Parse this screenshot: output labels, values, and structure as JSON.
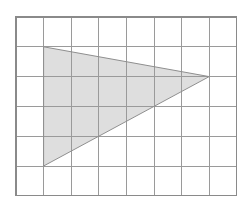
{
  "figure": {
    "background_color": "#ffffff"
  },
  "chart_data": {
    "type": "diagram",
    "grid": {
      "columns": 8,
      "rows": 6,
      "cell_width_units": 1,
      "cell_height_units": 1,
      "line_color": "#9a9a9a",
      "border_color": "#8a8a8a",
      "line_width_px": 1,
      "origin_px": {
        "x": 16,
        "y": 17
      },
      "cell_size_px": {
        "width": 27.6,
        "height": 29.8
      },
      "vertical_line_positions_px": [
        16,
        43.6,
        71.2,
        98.8,
        126.4,
        154,
        181.6,
        209.2,
        236.8
      ],
      "horizontal_line_positions_px": [
        17,
        46.8,
        76.6,
        106.4,
        136.2,
        166,
        195.8
      ]
    },
    "shapes": [
      {
        "name": "shaded-triangle",
        "type": "polygon",
        "vertices_grid": [
          {
            "col": 1,
            "row": 1
          },
          {
            "col": 7,
            "row": 2
          },
          {
            "col": 1,
            "row": 5
          }
        ],
        "vertices_px": [
          {
            "x": 43.6,
            "y": 46.8
          },
          {
            "x": 209.2,
            "y": 76.6
          },
          {
            "x": 43.6,
            "y": 166.0
          }
        ],
        "fill_color": "#dedede",
        "stroke_color": "#8f8f8f",
        "stroke_width_px": 1,
        "base_units": 4,
        "height_units": 6,
        "area_square_units": 12
      }
    ]
  }
}
